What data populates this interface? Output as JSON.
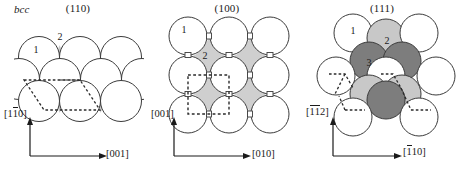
{
  "figure": {
    "structure_label": "bcc",
    "caption": ""
  },
  "panels": [
    {
      "id": "110",
      "plane": "(110)",
      "axis_vertical": {
        "text": "[110]",
        "parts": [
          "[",
          "1",
          "1",
          "0",
          "]"
        ],
        "bar_on": [
          2
        ]
      },
      "axis_horizontal": {
        "text": "[001]",
        "parts": [
          "[",
          "0",
          "0",
          "1",
          "]"
        ],
        "bar_on": []
      },
      "atom_labels": [
        "1",
        "2"
      ],
      "packing": "staggered-rows-3-4-3",
      "cell_shape": "rhombus"
    },
    {
      "id": "100",
      "plane": "(100)",
      "axis_vertical": {
        "text": "[001]",
        "parts": [
          "[",
          "0",
          "0",
          "1",
          "]"
        ],
        "bar_on": []
      },
      "axis_horizontal": {
        "text": "[010]",
        "parts": [
          "[",
          "0",
          "1",
          "0",
          "]"
        ],
        "bar_on": []
      },
      "atom_labels": [
        "1",
        "2"
      ],
      "packing": "square-grid-3x3",
      "cell_shape": "square"
    },
    {
      "id": "111",
      "plane": "(111)",
      "axis_vertical": {
        "text": "[112]",
        "parts": [
          "[",
          "1",
          "1",
          "2",
          "]"
        ],
        "bar_on": [
          1,
          2
        ]
      },
      "axis_horizontal": {
        "text": "[110]",
        "parts": [
          "[",
          "1",
          "1",
          "0",
          "]"
        ],
        "bar_on": [
          1
        ]
      },
      "atom_labels": [
        "1",
        "2",
        "3"
      ],
      "packing": "hexagonal-close-packed",
      "cell_shape": "dashed-segments"
    }
  ],
  "colors": {
    "outline": "#3b3b3b",
    "atom_white": "#ffffff",
    "atom_light_gray": "#c8c8c8",
    "atom_dark_gray": "#7d7d7d",
    "interstitial_gray": "#cfcfcf",
    "dashed": "#2b2b2b",
    "text": "#1a1a1a"
  }
}
